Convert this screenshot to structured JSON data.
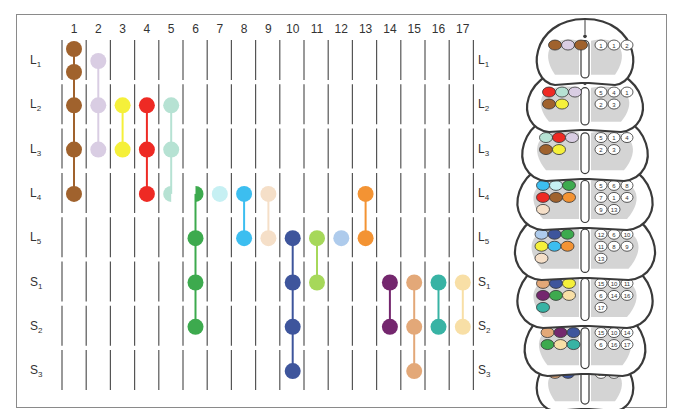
{
  "diagram": {
    "columns": [
      "1",
      "2",
      "3",
      "4",
      "5",
      "6",
      "7",
      "8",
      "9",
      "10",
      "11",
      "12",
      "13",
      "14",
      "15",
      "16",
      "17"
    ],
    "rows": [
      {
        "letter": "L",
        "sub": "1"
      },
      {
        "letter": "L",
        "sub": "2"
      },
      {
        "letter": "L",
        "sub": "3"
      },
      {
        "letter": "L",
        "sub": "4"
      },
      {
        "letter": "L",
        "sub": "5"
      },
      {
        "letter": "S",
        "sub": "1"
      },
      {
        "letter": "S",
        "sub": "2"
      },
      {
        "letter": "S",
        "sub": "3"
      }
    ],
    "muscle_groups": [
      {
        "column": 1,
        "color": "#a0622d",
        "segments": [
          0,
          0.5,
          1,
          2,
          3
        ],
        "note": "L1 (two dots), L2, L3, L4"
      },
      {
        "column": 2,
        "color": "#d9cde3",
        "segments": [
          0.2,
          1,
          2
        ]
      },
      {
        "column": 3,
        "color": "#f5f03a",
        "segments": [
          1,
          2
        ]
      },
      {
        "column": 4,
        "color": "#ee2a24",
        "segments": [
          1,
          2,
          3
        ]
      },
      {
        "column": 5,
        "color": "#b6e2d3",
        "segments": [
          1,
          2,
          3
        ],
        "half_at": 3
      },
      {
        "column": 6,
        "color": "#3daa4e",
        "segments": [
          3,
          4,
          5,
          6
        ],
        "half_at": 3
      },
      {
        "column": 7,
        "color": "#c6f0f3",
        "segments": [
          3
        ]
      },
      {
        "column": 8,
        "color": "#3cbef0",
        "segments": [
          3,
          4
        ]
      },
      {
        "column": 9,
        "color": "#f5dfc8",
        "segments": [
          3,
          4
        ]
      },
      {
        "column": 10,
        "color": "#3e559c",
        "segments": [
          4,
          5,
          6,
          7
        ]
      },
      {
        "column": 11,
        "color": "#a6d85a",
        "segments": [
          4,
          5
        ]
      },
      {
        "column": 12,
        "color": "#aecbec",
        "segments": [
          4
        ]
      },
      {
        "column": 13,
        "color": "#f39333",
        "segments": [
          3,
          4
        ]
      },
      {
        "column": 14,
        "color": "#74276e",
        "segments": [
          5,
          6
        ]
      },
      {
        "column": 15,
        "color": "#e3a878",
        "segments": [
          5,
          6,
          7
        ]
      },
      {
        "column": 16,
        "color": "#38b3a4",
        "segments": [
          5,
          6
        ]
      },
      {
        "column": 17,
        "color": "#f8dfa6",
        "segments": [
          5,
          6
        ]
      }
    ],
    "spinal_cord": {
      "segments": [
        "L1",
        "L2",
        "L3",
        "L4",
        "L5",
        "S1",
        "S2",
        "S3"
      ],
      "right_nuclei_numbers": {
        "L1": [
          "1",
          "1",
          "2"
        ],
        "L2": [
          "5",
          "4",
          "1",
          "2",
          "3"
        ],
        "L3": [
          "5",
          "1",
          "4",
          "2",
          "3"
        ],
        "L4": [
          "5",
          "6",
          "8",
          "7",
          "1",
          "4",
          "9",
          "13"
        ],
        "L5": [
          "12",
          "6",
          "10",
          "11",
          "8",
          "9",
          "13"
        ],
        "S1": [
          "15",
          "10",
          "11",
          "6",
          "14",
          "16",
          "17"
        ],
        "S2": [
          "15",
          "10",
          "14",
          "6",
          "16",
          "17"
        ],
        "S3": [
          "15",
          "10"
        ]
      }
    }
  },
  "colors": {
    "frame": "#8a8a8a",
    "grid_line": "#555555",
    "cord_gray": "#d4d4d4",
    "cord_outline": "#3a3a3a"
  }
}
